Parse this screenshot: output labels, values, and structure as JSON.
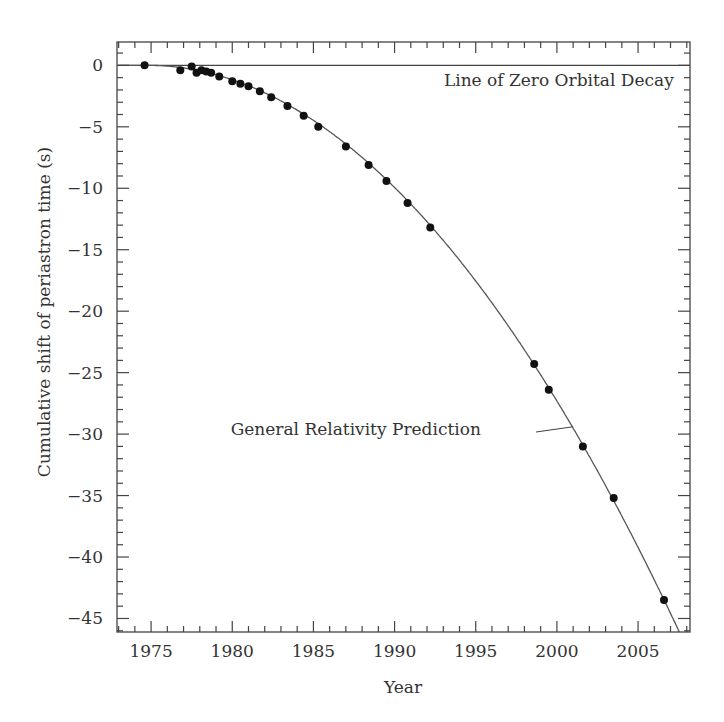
{
  "chart_data": {
    "type": "scatter",
    "title": "",
    "xlabel": "Year",
    "ylabel": "Cumulative shift of periastron time (s)",
    "xlim": [
      1972.9,
      2008.2
    ],
    "ylim": [
      -46.1,
      1.9
    ],
    "x_ticks": [
      1975,
      1980,
      1985,
      1990,
      1995,
      2000,
      2005
    ],
    "y_ticks": [
      0,
      -5,
      -10,
      -15,
      -20,
      -25,
      -30,
      -35,
      -40,
      -45
    ],
    "x_minor_step": 1,
    "y_minor_step": 1,
    "grid": false,
    "legend": null,
    "series": [
      {
        "name": "Measured periastron shift",
        "type": "scatter",
        "marker": "filled-circle",
        "x": [
          1974.6,
          1976.8,
          1977.5,
          1977.8,
          1978.1,
          1978.4,
          1978.7,
          1979.2,
          1980.0,
          1980.5,
          1981.0,
          1981.7,
          1982.4,
          1983.4,
          1984.4,
          1985.3,
          1987.0,
          1988.4,
          1989.5,
          1990.8,
          1992.2,
          1998.6,
          1999.5,
          2001.6,
          2003.5,
          2006.6
        ],
        "y": [
          0.0,
          -0.4,
          -0.1,
          -0.6,
          -0.4,
          -0.5,
          -0.6,
          -0.9,
          -1.3,
          -1.5,
          -1.7,
          -2.1,
          -2.6,
          -3.3,
          -4.1,
          -5.0,
          -6.6,
          -8.1,
          -9.4,
          -11.2,
          -13.2,
          -24.3,
          -26.4,
          -31.0,
          -35.2,
          -43.5
        ]
      },
      {
        "name": "General Relativity Prediction",
        "type": "line",
        "model": "y = -0.043 * (x - 1974.8)^2",
        "coef": -0.043,
        "t0": 1974.8
      },
      {
        "name": "Line of Zero Orbital Decay",
        "type": "line",
        "y_const": 0
      }
    ],
    "annotations": [
      {
        "text": "Line of Zero Orbital Decay",
        "x": 2007.2,
        "y": -1.2,
        "anchor": "end"
      },
      {
        "text": "General Relativity Prediction",
        "x": 1979.9,
        "y": -29.6,
        "anchor": "start",
        "pointer_to": [
          2001.0,
          -29.4
        ]
      }
    ]
  }
}
